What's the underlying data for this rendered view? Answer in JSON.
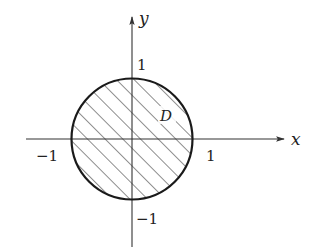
{
  "diagram": {
    "type": "region-diagram",
    "axes": {
      "x_label": "x",
      "y_label": "y"
    },
    "ticks": {
      "x_neg": "−1",
      "x_pos": "1",
      "y_pos": "1",
      "y_neg": "−1"
    },
    "region": {
      "label": "D",
      "shape": "circle",
      "center": [
        0,
        0
      ],
      "radius": 1,
      "fill": "diagonal-hatch"
    },
    "colors": {
      "stroke": "#1a1a1a",
      "axis": "#333333",
      "background": "#ffffff"
    }
  }
}
